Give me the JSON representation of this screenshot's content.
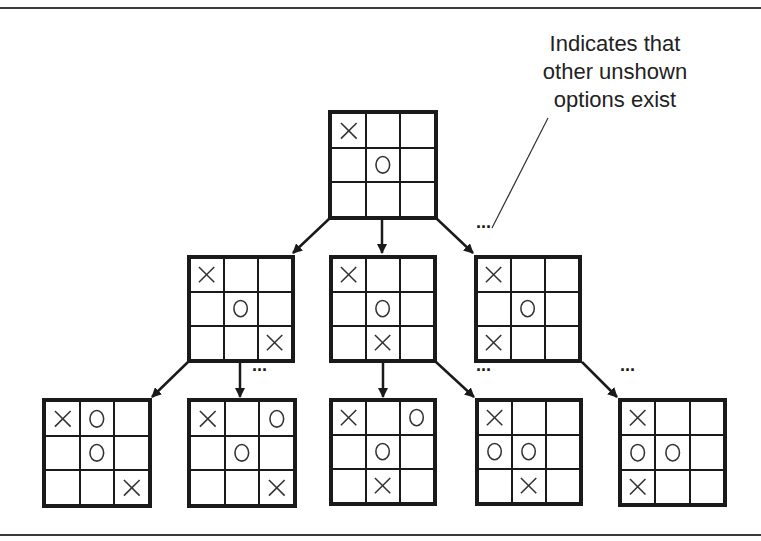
{
  "annotation": {
    "lines": [
      "Indicates that",
      "other unshown",
      "options exist"
    ]
  },
  "ellipsis": "...",
  "boards": [
    {
      "id": "root",
      "level": 0,
      "x": 328,
      "y": 110,
      "size": 110,
      "cells": [
        "X",
        "",
        "",
        "",
        "O",
        "",
        "",
        "",
        ""
      ]
    },
    {
      "id": "l2-a",
      "level": 1,
      "x": 187,
      "y": 255,
      "size": 108,
      "cells": [
        "X",
        "",
        "",
        "",
        "O",
        "",
        "",
        "",
        "X"
      ]
    },
    {
      "id": "l2-b",
      "level": 1,
      "x": 329,
      "y": 255,
      "size": 108,
      "cells": [
        "X",
        "",
        "",
        "",
        "O",
        "",
        "",
        "X",
        ""
      ]
    },
    {
      "id": "l2-c",
      "level": 1,
      "x": 474,
      "y": 255,
      "size": 108,
      "cells": [
        "X",
        "",
        "",
        "",
        "O",
        "",
        "X",
        "",
        ""
      ]
    },
    {
      "id": "l3-a",
      "level": 2,
      "x": 42,
      "y": 398,
      "size": 110,
      "cells": [
        "X",
        "O",
        "",
        "",
        "O",
        "",
        "",
        "",
        "X"
      ]
    },
    {
      "id": "l3-b",
      "level": 2,
      "x": 187,
      "y": 398,
      "size": 110,
      "cells": [
        "X",
        "",
        "O",
        "",
        "O",
        "",
        "",
        "",
        "X"
      ]
    },
    {
      "id": "l3-c",
      "level": 2,
      "x": 329,
      "y": 398,
      "size": 108,
      "cells": [
        "X",
        "",
        "O",
        "",
        "O",
        "",
        "",
        "X",
        ""
      ]
    },
    {
      "id": "l3-d",
      "level": 2,
      "x": 475,
      "y": 398,
      "size": 108,
      "cells": [
        "X",
        "",
        "",
        "O",
        "O",
        "",
        "",
        "X",
        ""
      ]
    },
    {
      "id": "l3-e",
      "level": 2,
      "x": 618,
      "y": 398,
      "size": 109,
      "cells": [
        "X",
        "",
        "",
        "O",
        "O",
        "",
        "X",
        "",
        ""
      ]
    }
  ],
  "arrows": [
    {
      "from": "root",
      "to": "l2-a",
      "x1": 330,
      "y1": 218,
      "x2": 293,
      "y2": 253
    },
    {
      "from": "root",
      "to": "l2-b",
      "x1": 382,
      "y1": 219,
      "x2": 382,
      "y2": 253
    },
    {
      "from": "root",
      "to": "l2-c",
      "x1": 436,
      "y1": 218,
      "x2": 473,
      "y2": 253
    },
    {
      "from": "l2-a",
      "to": "l3-a",
      "x1": 188,
      "y1": 362,
      "x2": 152,
      "y2": 397
    },
    {
      "from": "l2-a",
      "to": "l3-b",
      "x1": 240,
      "y1": 362,
      "x2": 240,
      "y2": 397
    },
    {
      "from": "l2-b",
      "to": "l3-c",
      "x1": 383,
      "y1": 362,
      "x2": 383,
      "y2": 397
    },
    {
      "from": "l2-b",
      "to": "l3-d",
      "x1": 436,
      "y1": 362,
      "x2": 474,
      "y2": 397
    },
    {
      "from": "l2-c",
      "to": "l3-e",
      "x1": 582,
      "y1": 362,
      "x2": 617,
      "y2": 397
    }
  ],
  "ellipses_positions": [
    {
      "x": 476,
      "y": 228
    },
    {
      "x": 252,
      "y": 371
    },
    {
      "x": 476,
      "y": 371
    },
    {
      "x": 620,
      "y": 371
    }
  ],
  "leader_line": {
    "x1": 548,
    "y1": 118,
    "x2": 492,
    "y2": 228
  }
}
